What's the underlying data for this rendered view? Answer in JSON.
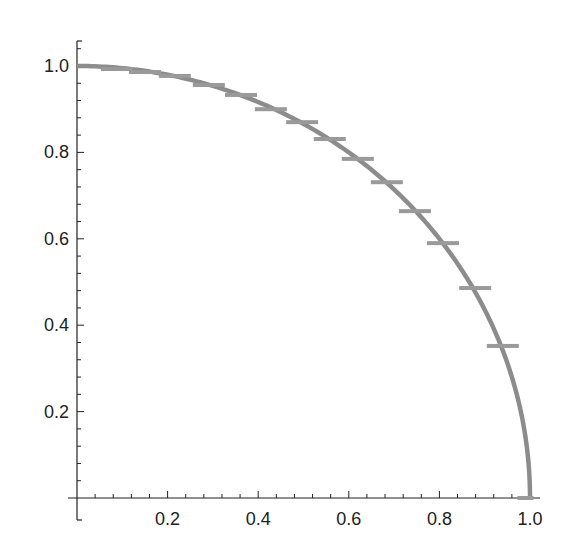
{
  "chart_data": {
    "type": "line",
    "title": "",
    "xlabel": "",
    "ylabel": "",
    "xlim": [
      0,
      1.0
    ],
    "ylim": [
      0,
      1.0
    ],
    "grid": false,
    "legend": null,
    "x_ticks": [
      {
        "value": 0.2,
        "label": "0.2"
      },
      {
        "value": 0.4,
        "label": "0.4"
      },
      {
        "value": 0.6,
        "label": "0.6"
      },
      {
        "value": 0.8,
        "label": "0.8"
      },
      {
        "value": 1.0,
        "label": "1.0"
      }
    ],
    "y_ticks": [
      {
        "value": 0.2,
        "label": "0.2"
      },
      {
        "value": 0.4,
        "label": "0.4"
      },
      {
        "value": 0.6,
        "label": "0.6"
      },
      {
        "value": 0.8,
        "label": "0.8"
      },
      {
        "value": 1.0,
        "label": "1.0"
      }
    ],
    "minor_ticks_per_major": 4,
    "series": [
      {
        "name": "curve",
        "kind": "line",
        "function": "y = sqrt(1 - x^2)",
        "x": [
          0,
          0.1,
          0.2,
          0.3,
          0.4,
          0.5,
          0.6,
          0.7,
          0.8,
          0.85,
          0.9,
          0.95,
          0.98,
          1.0
        ],
        "values": [
          1.0,
          0.995,
          0.98,
          0.954,
          0.917,
          0.866,
          0.8,
          0.714,
          0.6,
          0.527,
          0.436,
          0.312,
          0.199,
          0.0
        ]
      },
      {
        "name": "markers",
        "kind": "horizontal-dash",
        "x": [
          0.088,
          0.15,
          0.216,
          0.291,
          0.362,
          0.428,
          0.497,
          0.558,
          0.62,
          0.684,
          0.746,
          0.808,
          0.879,
          0.94,
          0.99
        ],
        "values": [
          0.993,
          0.986,
          0.977,
          0.956,
          0.933,
          0.9,
          0.87,
          0.831,
          0.785,
          0.731,
          0.664,
          0.59,
          0.486,
          0.352,
          0.0
        ]
      }
    ]
  },
  "style": {
    "axis_color": "#222222",
    "curve_color": "#8c8c8c",
    "marker_color": "#9a9a9a"
  }
}
